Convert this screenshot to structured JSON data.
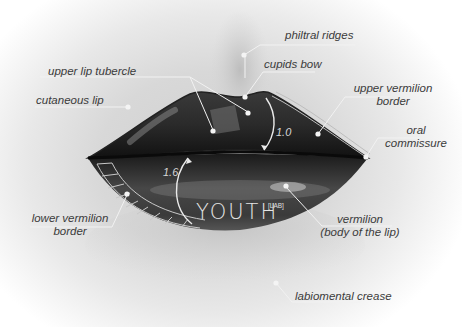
{
  "diagram": {
    "labels": {
      "philtral_ridges": "philtral ridges",
      "upper_lip_tubercle": "upper lip tubercle",
      "cupids_bow": "cupids bow",
      "cutaneous_lip": "cutaneous lip",
      "upper_vermilion_border_l1": "upper vermilion",
      "upper_vermilion_border_l2": "border",
      "oral_commissure_l1": "oral",
      "oral_commissure_l2": "commissure",
      "lower_vermilion_border_l1": "lower vermilion",
      "lower_vermilion_border_l2": "border",
      "vermilion_l1": "vermilion",
      "vermilion_l2": "(body of the lip)",
      "labiomental_crease": "labiomental crease"
    },
    "ratios": {
      "upper": "1.0",
      "lower": "1.6"
    },
    "watermark": "YOUTH",
    "watermark_suffix": "[LAB]"
  }
}
